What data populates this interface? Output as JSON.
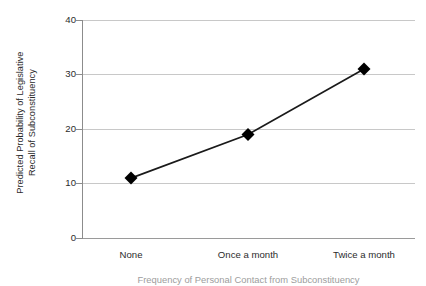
{
  "chart_data": {
    "type": "line",
    "title": "",
    "subtitle": "",
    "xlabel": "Frequency of Personal Contact from Subconstituency",
    "ylabel": "Predicted Probability of Legislative Recall of Subconstituency",
    "ylabel_lines": [
      "Predicted Probability of Legislative",
      "Recall of Subconstituency"
    ],
    "categories": [
      "None",
      "Once a month",
      "Twice a month"
    ],
    "values": [
      11,
      19,
      31
    ],
    "ylim": [
      0,
      40
    ],
    "yticks": [
      0,
      10,
      20,
      30,
      40
    ],
    "ytick_labels": [
      "0",
      "10",
      "20",
      "30",
      "40"
    ],
    "grid": "horizontal",
    "legend": "none",
    "marker": "diamond",
    "series": [
      {
        "name": "Predicted probability",
        "values": [
          11,
          19,
          31
        ]
      }
    ],
    "point_labels": [
      "None: 11",
      "Once a month: 19",
      "Twice a month: 31"
    ],
    "colors": {
      "line": "#1a1a1a",
      "marker": "#000000",
      "gridline": "#c8c8c8",
      "axis": "#8c8c8c",
      "background": "#ffffff",
      "text": "#2b2b2b"
    }
  }
}
